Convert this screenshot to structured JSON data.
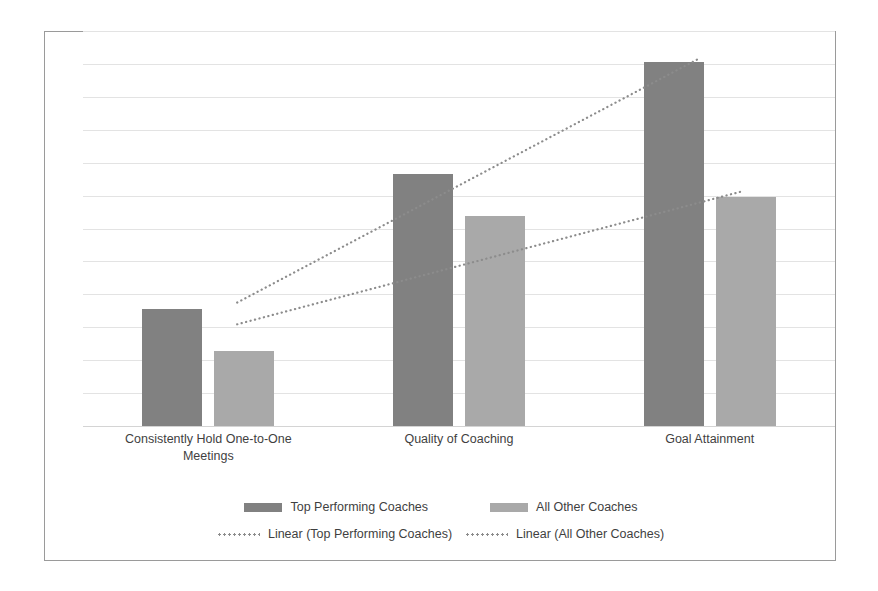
{
  "chart_data": {
    "type": "bar",
    "title": "",
    "xlabel": "",
    "ylabel": "",
    "grid": true,
    "legend_position": "bottom",
    "ylim": [
      0,
      12
    ],
    "gridline_count": 12,
    "categories": [
      "Consistently Hold One-to-One Meetings",
      "Quality of Coaching",
      "Goal Attainment"
    ],
    "category_lines": [
      [
        "Consistently Hold One-to-One",
        "Meetings"
      ],
      [
        "Quality of Coaching",
        ""
      ],
      [
        "Goal Attainment",
        ""
      ]
    ],
    "series": [
      {
        "name": "Top Performing Coaches",
        "color": "#818181",
        "values": [
          3.6,
          7.7,
          11.1
        ]
      },
      {
        "name": "All Other Coaches",
        "color": "#a9a9a9",
        "values": [
          2.3,
          6.4,
          7.0
        ]
      }
    ],
    "trendlines": [
      {
        "name": "Linear (Top Performing Coaches)",
        "of_series": "Top Performing Coaches",
        "style": "dotted",
        "color": "#8c8c8c",
        "start": [
          0.205,
          3.78
        ],
        "end": [
          0.818,
          11.18
        ]
      },
      {
        "name": "Linear (All Other Coaches)",
        "of_series": "All Other Coaches",
        "style": "dotted",
        "color": "#8c8c8c",
        "start": [
          0.205,
          3.12
        ],
        "end": [
          0.875,
          7.15
        ]
      }
    ]
  },
  "legend": {
    "row1": [
      {
        "label": "Top Performing Coaches",
        "swatch": "series-top"
      },
      {
        "label": "All Other Coaches",
        "swatch": "series-other"
      }
    ],
    "row2": [
      {
        "label": "Linear (Top Performing Coaches)"
      },
      {
        "label": "Linear (All Other Coaches)"
      }
    ]
  }
}
